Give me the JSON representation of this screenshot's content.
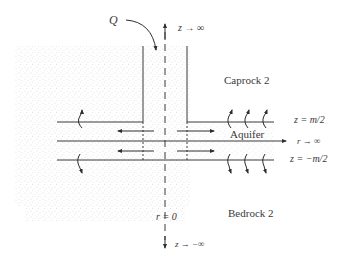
{
  "labels": {
    "flow_rate": "Q",
    "z_top": "z → ∞",
    "z_bottom": "z → −∞",
    "caprock": "Caprock 2",
    "aquifer": "Aquifer",
    "bedrock": "Bedrock 2",
    "top_boundary": "z = m/2",
    "bottom_boundary": "z = −m/2",
    "r_axis": "r → ∞",
    "centerline": "r = 0"
  },
  "colors": {
    "line": "#3a3a3a",
    "stipple": "#cfcfcf",
    "background": "#ffffff"
  },
  "icons": {
    "injection_arrow": "curved-arrow-down",
    "leakage_up": "curly-arrow-up",
    "leakage_down": "curly-arrow-down",
    "radial_flow": "arrow-horizontal"
  }
}
